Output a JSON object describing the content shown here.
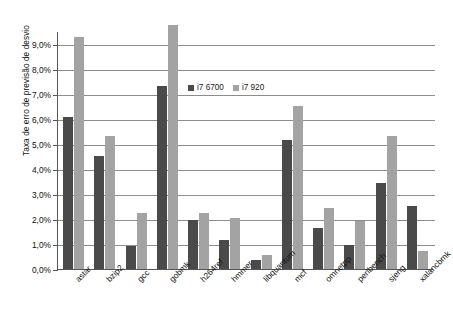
{
  "chart_data": {
    "type": "bar",
    "title": "",
    "xlabel": "",
    "ylabel": "Taxa de erro de previsão de desvio",
    "ylim": [
      0,
      9.5
    ],
    "ytick_values": [
      0,
      1,
      2,
      3,
      4,
      5,
      6,
      7,
      8,
      9
    ],
    "ytick_labels": [
      "0,0%",
      "1,0%",
      "2,0%",
      "3,0%",
      "4,0%",
      "5,0%",
      "6,0%",
      "7,0%",
      "8,0%",
      "9,0%"
    ],
    "grid": true,
    "legend_position": "inside-top-center",
    "categories": [
      "astar",
      "bzip2",
      "gcc",
      "gobmk",
      "h264ref",
      "hmmer",
      "libquantum",
      "mcf",
      "omnetpp",
      "perlbench",
      "sjeng",
      "xalancbmk"
    ],
    "series": [
      {
        "name": "i7 6700",
        "color": "#4a4a4a",
        "values": [
          6.05,
          4.5,
          0.92,
          7.3,
          1.95,
          1.15,
          0.35,
          5.15,
          1.65,
          0.95,
          3.45,
          2.5
        ]
      },
      {
        "name": "i7 920",
        "color": "#a3a3a3",
        "values": [
          9.25,
          5.3,
          2.25,
          9.75,
          2.25,
          2.05,
          0.55,
          6.5,
          2.45,
          1.9,
          5.3,
          0.7
        ]
      }
    ]
  },
  "axis_colors": {
    "axis_line": "#555555",
    "gridline": "#8d8d8d",
    "background": "#ffffff"
  }
}
